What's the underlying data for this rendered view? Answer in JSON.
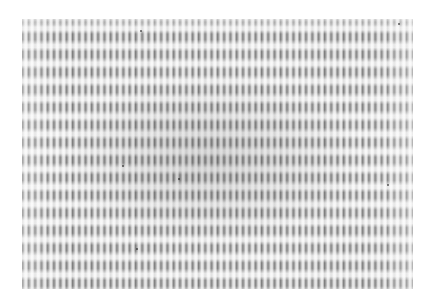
{
  "image": {
    "description": "Grayscale photograph of an interference / moire fringe pattern: fine vertical stripes modulated by periodic horizontal light and dark bands",
    "colors": {
      "background": "#ffffff",
      "fringe_dark": "#3a3a3a",
      "fringe_light": "#f0f0f0"
    },
    "pattern": {
      "vertical_stripe_period_px": 6.3,
      "horizontal_band_period_px": 17.6
    },
    "bounds": {
      "left": 22,
      "top": 19,
      "width": 391,
      "height": 270
    }
  }
}
